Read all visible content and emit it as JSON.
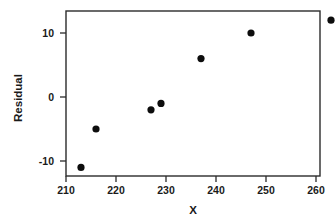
{
  "chart_data": {
    "type": "scatter",
    "title": "",
    "xlabel": "X",
    "ylabel": "Residual",
    "xlim": [
      209,
      265
    ],
    "ylim": [
      -13.5,
      13.5
    ],
    "grid": false,
    "legend": null,
    "xticks": [
      210,
      220,
      230,
      240,
      250,
      260
    ],
    "xtick_labels": [
      "210",
      "220",
      "230",
      "240",
      "250",
      "260"
    ],
    "yticks": [
      10,
      0,
      -10
    ],
    "ytick_labels": [
      "10",
      "0",
      "-10"
    ],
    "series": [
      {
        "name": "residuals",
        "marker": "filled-circle",
        "color": "#0d0d0d",
        "points": [
          {
            "x": 213,
            "y": -11
          },
          {
            "x": 216,
            "y": -5
          },
          {
            "x": 227,
            "y": -2
          },
          {
            "x": 229,
            "y": -1
          },
          {
            "x": 237,
            "y": 6
          },
          {
            "x": 247,
            "y": 10
          },
          {
            "x": 263,
            "y": 12
          }
        ]
      }
    ]
  },
  "axes": {
    "x_title": "X",
    "y_title": "Residual"
  }
}
